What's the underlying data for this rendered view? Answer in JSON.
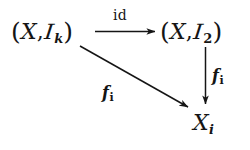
{
  "diagram": {
    "type": "commutative-diagram",
    "background_color": "#ffffff",
    "ink_color": "#151515",
    "nodes": [
      {
        "id": "top-left",
        "latex": "(X,\\mathcal{I}_k)",
        "open_paren": "(",
        "base": "X",
        "comma": ",",
        "script_symbol": "I",
        "subscript": "k",
        "close_paren": ")"
      },
      {
        "id": "top-right",
        "latex": "(X,\\mathcal{I}_2)",
        "open_paren": "(",
        "base": "X",
        "comma": ",",
        "script_symbol": "I",
        "subscript": "2",
        "close_paren": ")"
      },
      {
        "id": "bottom-right",
        "latex": "X_i",
        "base": "X",
        "subscript": "i"
      }
    ],
    "arrows": [
      {
        "id": "horizontal-id-arrow",
        "from": "top-left",
        "to": "top-right",
        "direction": "right",
        "label": "id",
        "label_style": "roman",
        "label_position": "above"
      },
      {
        "id": "vertical-f-arrow",
        "from": "top-right",
        "to": "bottom-right",
        "direction": "down",
        "label_base": "f",
        "label_subscript": "i",
        "label_style": "italic",
        "label_position": "right"
      },
      {
        "id": "diagonal-f-arrow",
        "from": "top-left",
        "to": "bottom-right",
        "direction": "down-right",
        "label_base": "f",
        "label_subscript": "i",
        "label_style": "italic",
        "label_position": "below-left"
      }
    ]
  }
}
